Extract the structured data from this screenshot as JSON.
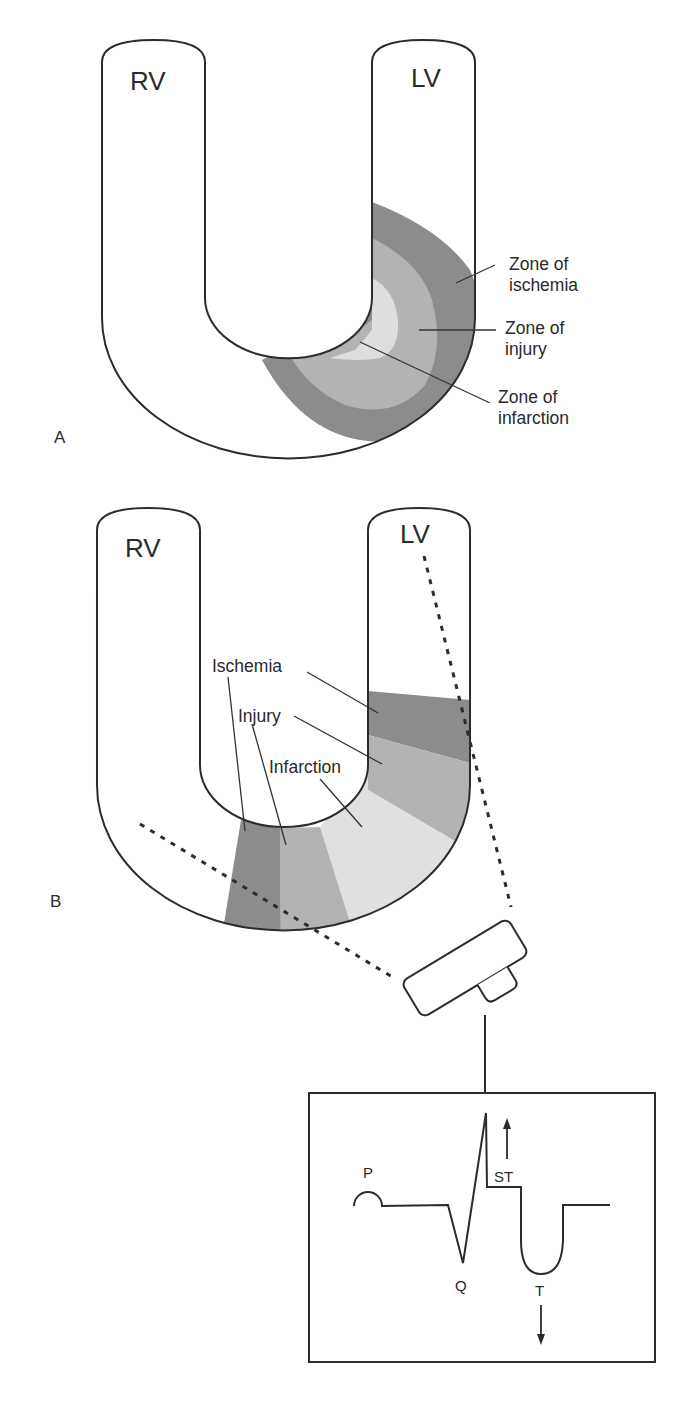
{
  "panel_a": {
    "letter": "A",
    "rv_label": "RV",
    "lv_label": "LV",
    "zones": [
      {
        "line1": "Zone of",
        "line2": "ischemia",
        "color": "#8a8a8a"
      },
      {
        "line1": "Zone of",
        "line2": "injury",
        "color": "#b0b0b0"
      },
      {
        "line1": "Zone of",
        "line2": "infarction",
        "color": "#dedede"
      }
    ]
  },
  "panel_b": {
    "letter": "B",
    "rv_label": "RV",
    "lv_label": "LV",
    "labels": {
      "ischemia": "Ischemia",
      "injury": "Injury",
      "infarction": "Infarction"
    },
    "colors": {
      "ischemia": "#8a8a8a",
      "injury": "#b0b0b0",
      "infarction": "#dedede"
    }
  },
  "ecg": {
    "p_label": "P",
    "q_label": "Q",
    "st_label": "ST",
    "t_label": "T",
    "st_direction": "up",
    "t_direction": "down"
  }
}
